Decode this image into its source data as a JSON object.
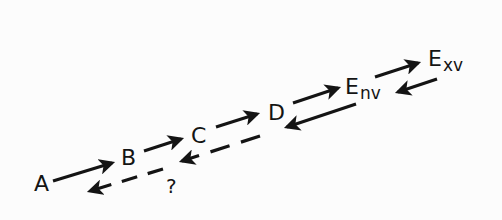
{
  "diagram": {
    "type": "reaction-scheme",
    "nodes": [
      {
        "id": "A",
        "label": "A",
        "sub": ""
      },
      {
        "id": "B",
        "label": "B",
        "sub": ""
      },
      {
        "id": "C",
        "label": "C",
        "sub": ""
      },
      {
        "id": "D",
        "label": "D",
        "sub": ""
      },
      {
        "id": "Env",
        "label": "E",
        "sub": "nv"
      },
      {
        "id": "Exv",
        "label": "E",
        "sub": "xv"
      }
    ],
    "edges": [
      {
        "from": "A",
        "to": "B",
        "style": "solid",
        "direction": "forward"
      },
      {
        "from": "B",
        "to": "C",
        "style": "solid",
        "direction": "forward"
      },
      {
        "from": "C",
        "to": "D",
        "style": "solid",
        "direction": "forward"
      },
      {
        "from": "D",
        "to": "Env",
        "style": "solid",
        "direction": "forward"
      },
      {
        "from": "Env",
        "to": "Exv",
        "style": "solid",
        "direction": "forward"
      },
      {
        "from": "Exv",
        "to": "Env",
        "style": "solid",
        "direction": "reverse"
      },
      {
        "from": "Env",
        "to": "D",
        "style": "solid",
        "direction": "reverse"
      },
      {
        "from": "D",
        "to": "C",
        "style": "dashed",
        "direction": "reverse"
      },
      {
        "from": "B",
        "to": "A",
        "style": "dashed",
        "direction": "reverse"
      }
    ],
    "annotations": [
      {
        "label": "?",
        "near": "B-A reverse path"
      }
    ],
    "colors": {
      "ink": "#141414",
      "background": "#fcfcfc"
    }
  }
}
